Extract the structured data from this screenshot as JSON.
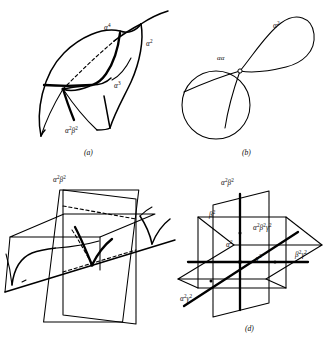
{
  "figure": {
    "kind": "four-panel-mathematical-diagram",
    "background_color": "#ffffff",
    "ink_color": "#000000",
    "panels": [
      {
        "id": "a",
        "caption": "(a)",
        "description": "curved surface patch with a cuspidal edge and transverse self-intersection curve",
        "labels": [
          {
            "name": "alpha-4",
            "text": "α",
            "sup": "4"
          },
          {
            "name": "alpha-2",
            "text": "α",
            "sup": "2"
          },
          {
            "name": "alpha-3",
            "text": "α",
            "sup": "3"
          },
          {
            "name": "alpha-2-beta-2",
            "text": "α",
            "sup": "2",
            "text2": "β",
            "sup2": "2"
          }
        ]
      },
      {
        "id": "b",
        "caption": "(b)",
        "description": "figure-eight curve with one node where two branches cross",
        "labels": [
          {
            "name": "alpha-alpha",
            "text": "αα",
            "sup": ""
          },
          {
            "name": "alpha-2",
            "text": "α",
            "sup": "2"
          }
        ]
      },
      {
        "id": "c",
        "caption": "(c)",
        "description": "two transverse planes meeting along a line with cuspidal curves drawn on them",
        "labels": [
          {
            "name": "alpha-2-beta-2-top",
            "text": "α",
            "sup": "2",
            "text2": "β",
            "sup2": "2"
          },
          {
            "name": "alpha-2",
            "text": "α",
            "sup": "2"
          },
          {
            "name": "alpha-3",
            "text": "α",
            "sup": "3"
          },
          {
            "name": "alpha-3-beta-2",
            "text": "α",
            "sup": "3",
            "text2": "β",
            "sup2": "2"
          },
          {
            "name": "beta-2",
            "text": "β",
            "sup": "2"
          }
        ]
      },
      {
        "id": "d",
        "caption": "(d)",
        "description": "three mutually transverse planes meeting at a single triple point",
        "labels": [
          {
            "name": "alpha-2-beta-2-top",
            "text": "α",
            "sup": "2",
            "text2": "β",
            "sup2": "2"
          },
          {
            "name": "beta-2",
            "text": "β",
            "sup": "2"
          },
          {
            "name": "alpha-2",
            "text": "α",
            "sup": "2"
          },
          {
            "name": "alpha-2-beta-2-gamma-2",
            "text": "α",
            "sup": "2",
            "text2": "β",
            "sup2": "2",
            "text3": "γ",
            "sup3": "2"
          },
          {
            "name": "gamma-2",
            "text": "γ",
            "sup": "2"
          },
          {
            "name": "beta-2-gamma-2",
            "text": "β",
            "sup": "2",
            "text2": "γ",
            "sup2": "2"
          },
          {
            "name": "alpha-2-gamma-2",
            "text": "α",
            "sup": "2",
            "text2": "γ",
            "sup2": "2"
          }
        ]
      }
    ]
  },
  "labels": {
    "a": {
      "alpha4": "α⁴",
      "alpha2": "α²",
      "alpha3": "α³",
      "alpha2beta2": "α²β²",
      "caption": "(a)"
    },
    "b": {
      "alphaalpha": "αα",
      "alpha2": "α²",
      "caption": "(b)"
    },
    "c": {
      "alpha2beta2_top": "α²β²",
      "alpha2": "α²",
      "alpha3": "α³",
      "alpha3beta2": "α³β²",
      "beta2": "β²",
      "caption": "(c)"
    },
    "d": {
      "alpha2beta2_top": "α²β²",
      "beta2": "β²",
      "alpha2": "α²",
      "alpha2beta2gamma2": "α²β²γ²",
      "gamma2": "γ²",
      "beta2gamma2": "β²γ²",
      "alpha2gamma2": "α²γ²",
      "caption": "(d)"
    }
  }
}
